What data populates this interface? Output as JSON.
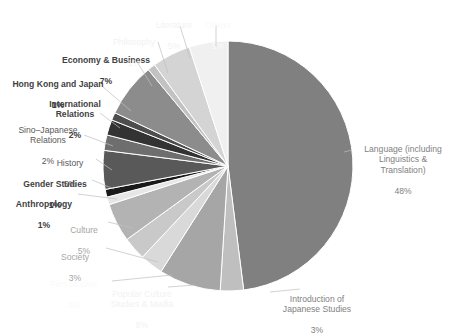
{
  "chart_data": {
    "type": "pie",
    "title": "",
    "legend_position": "none",
    "grid": false,
    "categories": [
      "Language (including Linguistics & Translation)",
      "Introduction of Japanese Studies",
      "Popular Culture Studies & Media",
      "Film Studies",
      "Society",
      "Culture",
      "Anthropology",
      "Gender Studies",
      "History",
      "Sino-Japanese Relations",
      "International Relations",
      "Hong Kong and Japan",
      "Economy & Business",
      "Philosophy",
      "Literature",
      "Others"
    ],
    "values": [
      48,
      3,
      8,
      3,
      3,
      5,
      1,
      1,
      5,
      2,
      2,
      1,
      7,
      1,
      5,
      5
    ],
    "value_labels": [
      "48%",
      "3%",
      "8%",
      "3%",
      "3%",
      "5%",
      "1%",
      "1%",
      "5%",
      "2%",
      "2%",
      "1%",
      "7%",
      "1%",
      "5%",
      "5%"
    ],
    "colors": [
      "#808080",
      "#bfbfbf",
      "#a6a6a6",
      "#d9d9d9",
      "#c9c9c9",
      "#b3b3b3",
      "#e6e6e6",
      "#1a1a1a",
      "#595959",
      "#6e6e6e",
      "#333333",
      "#4d4d4d",
      "#8c8c8c",
      "#c2c2c2",
      "#d4d4d4",
      "#f0f0f0"
    ],
    "xlabel": "",
    "ylabel": ""
  },
  "labels": {
    "language": {
      "name": "Language (including\nLinguistics &\nTranslation)",
      "value": "48%"
    },
    "introduction": {
      "name": "Introduction of\nJapanese Studies",
      "value": "3%"
    },
    "popular_culture": {
      "name": "Popular Culture\nStudies & Media",
      "value": "8%"
    },
    "film_studies": {
      "name": "Film Studies",
      "value": "3%"
    },
    "society": {
      "name": "Society",
      "value": "3%"
    },
    "culture": {
      "name": "Culture",
      "value": "5%"
    },
    "anthropology": {
      "name": "Anthropology",
      "value": "1%"
    },
    "gender_studies": {
      "name": "Gender Studies",
      "value": "1%"
    },
    "history": {
      "name": "History",
      "value": "5%"
    },
    "sino_japanese": {
      "name": "Sino–Japanese\nRelations",
      "value": "2%"
    },
    "international": {
      "name": "International\nRelations",
      "value": "2%"
    },
    "hong_kong": {
      "name": "Hong Kong and Japan",
      "value": "1%"
    },
    "economy": {
      "name": "Economy & Business",
      "value": "7%"
    },
    "philosophy": {
      "name": "Philosophy",
      "value": "1%"
    },
    "literature": {
      "name": "Literature",
      "value": "5%"
    },
    "others": {
      "name": "Others",
      "value": "5%"
    }
  }
}
